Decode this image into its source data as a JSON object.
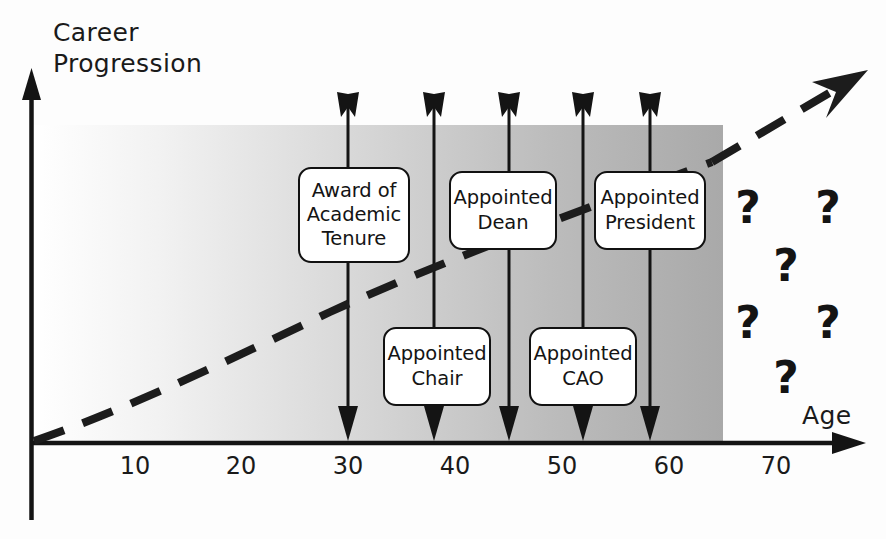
{
  "figure": {
    "title_axis_y": "Career\nProgression",
    "title_axis_x": "Age"
  },
  "chart_data": {
    "type": "scatter",
    "title": "",
    "xlabel": "Age",
    "ylabel": "Career Progression",
    "xlim": [
      0,
      78
    ],
    "ylim": [
      0,
      100
    ],
    "grid": false,
    "legend": null,
    "xticks": [
      10,
      20,
      30,
      40,
      50,
      60,
      70
    ],
    "xtick_labels": [
      "10",
      "20",
      "30",
      "40",
      "50",
      "60",
      "70"
    ],
    "yticks": [],
    "shaded_region": {
      "x_start": 0,
      "x_end": 65,
      "fill_from": "#ffffff",
      "fill_to": "#a8a8a8",
      "note": "left-to-right white-to-gray gradient band under career trajectory"
    },
    "trend_curve": {
      "style": "dashed",
      "description": "Rising career progression trajectory from origin, arrowhead at upper right",
      "points": [
        {
          "x": 0,
          "y": 0
        },
        {
          "x": 10,
          "y": 17
        },
        {
          "x": 20,
          "y": 29
        },
        {
          "x": 30,
          "y": 39
        },
        {
          "x": 40,
          "y": 49
        },
        {
          "x": 50,
          "y": 59
        },
        {
          "x": 58,
          "y": 67
        },
        {
          "x": 65,
          "y": 76
        },
        {
          "x": 74,
          "y": 92
        }
      ]
    },
    "events": [
      {
        "id": "tenure",
        "age": 30,
        "label": "Award of\nAcademic\nTenure",
        "row": "upper"
      },
      {
        "id": "chair",
        "age": 38,
        "label": "Appointed\nChair",
        "row": "lower"
      },
      {
        "id": "dean",
        "age": 45,
        "label": "Appointed\nDean",
        "row": "upper"
      },
      {
        "id": "cao",
        "age": 52,
        "label": "Appointed\nCAO",
        "row": "lower"
      },
      {
        "id": "president",
        "age": 58,
        "label": "Appointed\nPresident",
        "row": "upper"
      }
    ],
    "unknown_future_markers": {
      "glyph": "?",
      "count": 6,
      "positions": [
        {
          "x": 69.5,
          "y": 62
        },
        {
          "x": 74.5,
          "y": 62
        },
        {
          "x": 72.0,
          "y": 45
        },
        {
          "x": 69.5,
          "y": 30
        },
        {
          "x": 74.5,
          "y": 30
        },
        {
          "x": 72.0,
          "y": 14
        }
      ]
    }
  },
  "ticks": [
    {
      "label": "10",
      "x": 135
    },
    {
      "label": "20",
      "x": 241
    },
    {
      "label": "30",
      "x": 348
    },
    {
      "label": "40",
      "x": 455
    },
    {
      "label": "50",
      "x": 562
    },
    {
      "label": "60",
      "x": 669
    },
    {
      "label": "70",
      "x": 776
    }
  ],
  "boxes": [
    {
      "id": "box-tenure",
      "label": "Award of\nAcademic\nTenure",
      "left": 298,
      "top": 167,
      "width": 112,
      "height": 96
    },
    {
      "id": "box-dean",
      "label": "Appointed\nDean",
      "left": 449,
      "top": 171,
      "width": 108,
      "height": 79
    },
    {
      "id": "box-president",
      "label": "Appointed\nPresident",
      "left": 594,
      "top": 171,
      "width": 112,
      "height": 79
    },
    {
      "id": "box-chair",
      "label": "Appointed\nChair",
      "left": 383,
      "top": 327,
      "width": 108,
      "height": 79
    },
    {
      "id": "box-cao",
      "label": "Appointed\nCAO",
      "left": 529,
      "top": 327,
      "width": 108,
      "height": 79
    }
  ],
  "question_marks": [
    {
      "x": 748,
      "y": 207
    },
    {
      "x": 828,
      "y": 207
    },
    {
      "x": 786,
      "y": 265
    },
    {
      "x": 748,
      "y": 322
    },
    {
      "x": 828,
      "y": 322
    },
    {
      "x": 786,
      "y": 377
    }
  ],
  "colors": {
    "ink": "#141414",
    "gradient_start": "#ffffff",
    "gradient_end": "#a9a9a9",
    "paper": "#fdfdfd"
  }
}
